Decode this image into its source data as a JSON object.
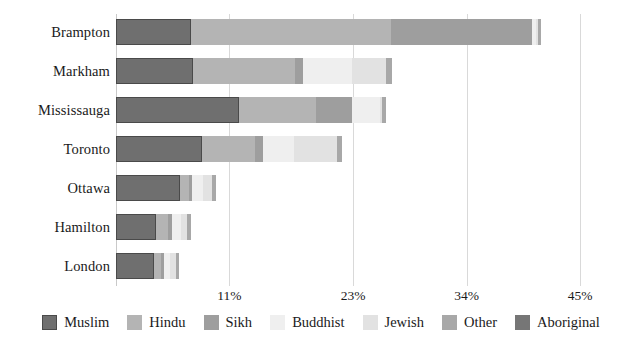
{
  "chart_data": {
    "type": "bar",
    "orientation": "horizontal",
    "stacked": true,
    "title": "",
    "subtitle": "",
    "xlabel": "",
    "ylabel": "",
    "categories": [
      "Brampton",
      "Markham",
      "Mississauga",
      "Toronto",
      "Ottawa",
      "Hamilton",
      "London"
    ],
    "series": [
      {
        "name": "Muslim",
        "color": "#6f6f6f",
        "values": [
          7.3,
          7.5,
          11.9,
          8.3,
          6.2,
          3.9,
          3.7
        ]
      },
      {
        "name": "Hindu",
        "color": "#b4b4b4",
        "values": [
          19.4,
          9.9,
          7.5,
          5.2,
          0.9,
          1.1,
          0.7
        ]
      },
      {
        "name": "Sikh",
        "color": "#9e9e9e",
        "values": [
          13.6,
          0.7,
          3.5,
          0.8,
          0.3,
          0.4,
          0.3
        ]
      },
      {
        "name": "Buddhist",
        "color": "#efefef",
        "values": [
          0.4,
          4.8,
          2.7,
          3.0,
          1.0,
          0.9,
          0.5
        ]
      },
      {
        "name": "Jewish",
        "color": "#e2e2e2",
        "values": [
          0.2,
          3.3,
          0.2,
          4.1,
          0.9,
          0.6,
          0.6
        ]
      },
      {
        "name": "Other",
        "color": "#a8a8a8",
        "values": [
          0.3,
          0.6,
          0.4,
          0.5,
          0.4,
          0.4,
          0.3
        ]
      },
      {
        "name": "Aboriginal",
        "color": "#767676",
        "values": [
          0.0,
          0.0,
          0.0,
          0.0,
          0.0,
          0.0,
          0.0
        ]
      }
    ],
    "xticks": [
      {
        "value": 11,
        "label": "11%"
      },
      {
        "value": 23,
        "label": "23%"
      },
      {
        "value": 34,
        "label": "34%"
      },
      {
        "value": 45,
        "label": "45%"
      }
    ],
    "xlim": [
      0,
      45
    ],
    "grid": true,
    "legend_position": "bottom",
    "legend": [
      "Muslim",
      "Hindu",
      "Sikh",
      "Buddhist",
      "Jewish",
      "Other",
      "Aboriginal"
    ]
  },
  "colors": {
    "muslim": "#6f6f6f",
    "hindu": "#b4b4b4",
    "sikh": "#9e9e9e",
    "buddhist": "#efefef",
    "jewish": "#e2e2e2",
    "other": "#a8a8a8",
    "aboriginal": "#767676",
    "gridline": "#d9d9d9",
    "axis": "#c9c9c9",
    "text": "#1a1a1a",
    "background": "#ffffff"
  }
}
